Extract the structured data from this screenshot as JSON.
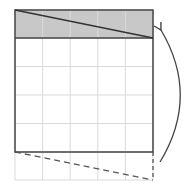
{
  "diagram": {
    "grid": {
      "columns": 5,
      "rows": 6,
      "x_lines": [
        15,
        42.6,
        70.2,
        97.8,
        125.4,
        153
      ],
      "y_lines": [
        10,
        38,
        66.5,
        95,
        123.5,
        152,
        180
      ],
      "line_color": "#d9d9d9"
    },
    "solid_rectangle": {
      "x": 15,
      "y": 10,
      "width": 138,
      "height": 142,
      "stroke": "#444444"
    },
    "shaded_row": {
      "x": 15,
      "y": 10,
      "width": 138,
      "height": 28,
      "fill": "#c8c8c8",
      "diagonal": {
        "x1": 15,
        "y1": 10,
        "x2": 153,
        "y2": 38
      }
    },
    "dashed_region": {
      "diagonal": {
        "x1": 15,
        "y1": 152,
        "x2": 153,
        "y2": 180
      },
      "right_edge": {
        "x1": 153,
        "y1": 152,
        "x2": 153,
        "y2": 180
      },
      "stroke": "#555555"
    },
    "arrow": {
      "path": "M 160 162 Q 200 96 161 30",
      "direction": "up",
      "meaning": "move bottom strip to top",
      "stroke": "#444444"
    }
  }
}
